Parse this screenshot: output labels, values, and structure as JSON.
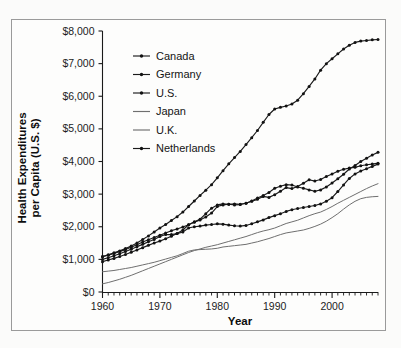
{
  "chart_data": {
    "type": "line",
    "title": "",
    "xlabel": "Year",
    "ylabel": "Health Expenditures per Capita (U.S. $)",
    "xlim": [
      1960,
      2008
    ],
    "ylim": [
      0,
      8000
    ],
    "grid": false,
    "legend_position": "upper left inside plot area",
    "x_tick_labels": [
      "1960",
      "1970",
      "1980",
      "1990",
      "2000"
    ],
    "x_tick_values": [
      1960,
      1970,
      1980,
      1990,
      2000
    ],
    "x_minor_tick_interval": 1,
    "y_tick_labels": [
      "$0",
      "$1,000",
      "$2,000",
      "$3,000",
      "$4,000",
      "$5,000",
      "$6,000",
      "$7,000",
      "$8,000"
    ],
    "y_tick_values": [
      0,
      1000,
      2000,
      3000,
      4000,
      5000,
      6000,
      7000,
      8000
    ],
    "x": [
      1960,
      1961,
      1962,
      1963,
      1964,
      1965,
      1966,
      1967,
      1968,
      1969,
      1970,
      1971,
      1972,
      1973,
      1974,
      1975,
      1976,
      1977,
      1978,
      1979,
      1980,
      1981,
      1982,
      1983,
      1984,
      1985,
      1986,
      1987,
      1988,
      1989,
      1990,
      1991,
      1992,
      1993,
      1994,
      1995,
      1996,
      1997,
      1998,
      1999,
      2000,
      2001,
      2002,
      2003,
      2004,
      2005,
      2006,
      2007,
      2008
    ],
    "series": [
      {
        "name": "Canada",
        "marker": "dot",
        "values": [
          1080,
          1130,
          1180,
          1240,
          1300,
          1370,
          1450,
          1530,
          1600,
          1670,
          1740,
          1810,
          1880,
          1930,
          1990,
          2060,
          2140,
          2210,
          2300,
          2420,
          2620,
          2670,
          2690,
          2700,
          2690,
          2720,
          2790,
          2880,
          2960,
          3050,
          3180,
          3240,
          3290,
          3280,
          3220,
          3180,
          3130,
          3090,
          3130,
          3220,
          3340,
          3470,
          3610,
          3770,
          3880,
          4000,
          4100,
          4200,
          4280
        ]
      },
      {
        "name": "Germany",
        "marker": "dot",
        "values": [
          930,
          980,
          1030,
          1090,
          1150,
          1220,
          1290,
          1360,
          1430,
          1500,
          1560,
          1630,
          1710,
          1790,
          1900,
          2060,
          2150,
          2230,
          2400,
          2570,
          2670,
          2700,
          2690,
          2670,
          2680,
          2720,
          2780,
          2840,
          2930,
          2900,
          2980,
          3090,
          3200,
          3170,
          3230,
          3330,
          3440,
          3400,
          3450,
          3540,
          3620,
          3700,
          3760,
          3800,
          3820,
          3870,
          3900,
          3920,
          3950
        ]
      },
      {
        "name": "U.S.",
        "marker": "dot",
        "values": [
          1090,
          1140,
          1200,
          1260,
          1330,
          1410,
          1500,
          1610,
          1720,
          1840,
          1960,
          2070,
          2190,
          2310,
          2450,
          2620,
          2790,
          2960,
          3120,
          3290,
          3500,
          3720,
          3930,
          4120,
          4310,
          4520,
          4730,
          4950,
          5200,
          5440,
          5610,
          5660,
          5700,
          5760,
          5880,
          6080,
          6300,
          6530,
          6800,
          7000,
          7150,
          7300,
          7450,
          7560,
          7650,
          7690,
          7710,
          7730,
          7740
        ]
      },
      {
        "name": "Japan",
        "marker": "none",
        "values": [
          250,
          290,
          340,
          390,
          450,
          510,
          580,
          650,
          720,
          790,
          860,
          930,
          1000,
          1070,
          1140,
          1210,
          1270,
          1320,
          1370,
          1410,
          1450,
          1500,
          1550,
          1600,
          1650,
          1700,
          1760,
          1820,
          1870,
          1910,
          1960,
          2030,
          2100,
          2150,
          2200,
          2270,
          2340,
          2400,
          2450,
          2530,
          2620,
          2720,
          2810,
          2900,
          2990,
          3080,
          3170,
          3250,
          3320
        ]
      },
      {
        "name": "U.K.",
        "marker": "none",
        "values": [
          620,
          640,
          660,
          690,
          720,
          750,
          790,
          830,
          870,
          910,
          960,
          1010,
          1060,
          1110,
          1180,
          1250,
          1290,
          1300,
          1310,
          1320,
          1340,
          1380,
          1400,
          1420,
          1440,
          1460,
          1500,
          1540,
          1590,
          1640,
          1700,
          1760,
          1810,
          1840,
          1870,
          1900,
          1950,
          2010,
          2080,
          2170,
          2280,
          2400,
          2540,
          2670,
          2780,
          2860,
          2900,
          2920,
          2930
        ]
      },
      {
        "name": "Netherlands",
        "marker": "dot",
        "values": [
          1000,
          1050,
          1110,
          1170,
          1240,
          1310,
          1390,
          1460,
          1540,
          1610,
          1700,
          1760,
          1760,
          1790,
          1840,
          1960,
          2000,
          2020,
          2050,
          2070,
          2090,
          2080,
          2050,
          2030,
          2020,
          2040,
          2090,
          2150,
          2210,
          2280,
          2340,
          2400,
          2470,
          2520,
          2560,
          2590,
          2620,
          2650,
          2700,
          2780,
          2890,
          3080,
          3280,
          3480,
          3620,
          3710,
          3780,
          3850,
          3920
        ]
      }
    ]
  },
  "axes": {
    "y_title": "Health Expenditures per Capita (U.S. $)",
    "y_title_line1": "Health Expenditures",
    "y_title_line2": "per Capita (U.S. $)",
    "x_title": "Year"
  },
  "legend": {
    "items": [
      {
        "label": "Canada"
      },
      {
        "label": "Germany"
      },
      {
        "label": "U.S."
      },
      {
        "label": "Japan"
      },
      {
        "label": "U.K."
      },
      {
        "label": "Netherlands"
      }
    ]
  },
  "colors": {
    "line_dark": "#1b1b1b",
    "line_light": "#6f6f6f",
    "axis": "#1a1a1a",
    "frame": "#9a9a9a",
    "background": "#fdfdfc"
  }
}
